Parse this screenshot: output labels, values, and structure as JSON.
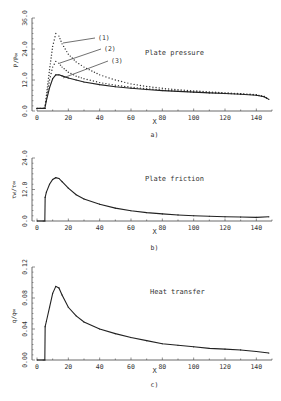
{
  "chart_data": [
    {
      "type": "line",
      "panel_label": "a)",
      "title": "Plate pressure",
      "xlabel": "X",
      "ylabel": "P/P∞",
      "xlim": [
        0,
        150
      ],
      "ylim": [
        0,
        36
      ],
      "xticks": [
        0,
        20,
        40,
        60,
        80,
        100,
        120,
        140
      ],
      "yticks": [
        0.0,
        12.0,
        24.0,
        36.0
      ],
      "ytick_labels": [
        "0.0",
        "12.0",
        "24.0",
        "36.0"
      ],
      "x": [
        0,
        4,
        5,
        6,
        8,
        10,
        12,
        14,
        16,
        20,
        25,
        30,
        40,
        50,
        60,
        70,
        80,
        90,
        100,
        110,
        120,
        130,
        140,
        145,
        148
      ],
      "series": [
        {
          "name": "(1)",
          "style": "dotted",
          "values": [
            1,
            1,
            1,
            6,
            16,
            25,
            30,
            29,
            26,
            22,
            19,
            17,
            14,
            12,
            10.5,
            9.5,
            8.8,
            8.2,
            7.8,
            7.4,
            7.0,
            6.7,
            6.3,
            5.6,
            4.5
          ]
        },
        {
          "name": "(2)",
          "style": "dotted",
          "values": [
            1,
            1,
            1,
            5,
            12,
            17,
            19.2,
            18.5,
            17,
            15,
            13.5,
            12.5,
            11,
            10,
            9.2,
            8.6,
            8.1,
            7.7,
            7.4,
            7.1,
            6.8,
            6.6,
            6.2,
            5.6,
            4.5
          ]
        },
        {
          "name": "(3)",
          "style": "solid",
          "values": [
            1,
            1,
            1,
            4,
            9,
            12.5,
            14,
            14,
            13.6,
            12.8,
            12,
            11.2,
            10.2,
            9.4,
            8.8,
            8.3,
            7.9,
            7.6,
            7.3,
            7.0,
            6.8,
            6.5,
            6.1,
            5.5,
            4.5
          ]
        }
      ],
      "annotations": [
        "(1)",
        "(2)",
        "(3)"
      ]
    },
    {
      "type": "line",
      "panel_label": "b)",
      "title": "Plate friction",
      "xlabel": "X",
      "ylabel": "τw/τ∞",
      "xlim": [
        0,
        150
      ],
      "ylim": [
        0,
        24
      ],
      "xticks": [
        0,
        20,
        40,
        60,
        80,
        100,
        120,
        140
      ],
      "yticks": [
        0.0,
        12.0,
        24.0
      ],
      "ytick_labels": [
        "0.0",
        "12.0",
        "24.0"
      ],
      "x": [
        0,
        4,
        5,
        5.2,
        6,
        8,
        10,
        12,
        14,
        16,
        20,
        25,
        30,
        40,
        50,
        60,
        70,
        80,
        90,
        100,
        110,
        120,
        130,
        140,
        148
      ],
      "series": [
        {
          "name": "friction",
          "style": "solid",
          "values": [
            0,
            0,
            0,
            9,
            11,
            14,
            15.8,
            16.5,
            16.2,
            15,
            12.5,
            10,
            8.4,
            6.4,
            4.9,
            3.9,
            3.2,
            2.7,
            2.3,
            2.0,
            1.8,
            1.6,
            1.5,
            1.4,
            1.6
          ]
        }
      ]
    },
    {
      "type": "line",
      "panel_label": "c)",
      "title": "Heat transfer",
      "xlabel": "X",
      "ylabel": "q/q∞",
      "xlim": [
        0,
        150
      ],
      "ylim": [
        0,
        0.12
      ],
      "xticks": [
        0,
        20,
        40,
        60,
        80,
        100,
        120,
        140
      ],
      "yticks": [
        0.0,
        0.04,
        0.08,
        0.12
      ],
      "ytick_labels": [
        "0.00",
        "0.04",
        "0.08",
        "0.12"
      ],
      "x": [
        0,
        4,
        5,
        5.2,
        6,
        8,
        10,
        12,
        14,
        16,
        20,
        25,
        30,
        40,
        50,
        60,
        70,
        80,
        90,
        100,
        110,
        120,
        130,
        140,
        148
      ],
      "series": [
        {
          "name": "heat",
          "style": "solid",
          "values": [
            0,
            0,
            0,
            0.043,
            0.05,
            0.068,
            0.086,
            0.095,
            0.093,
            0.084,
            0.068,
            0.057,
            0.049,
            0.04,
            0.034,
            0.029,
            0.025,
            0.021,
            0.019,
            0.017,
            0.015,
            0.014,
            0.013,
            0.011,
            0.009
          ]
        }
      ]
    }
  ],
  "panels": {
    "a": {
      "title": "Plate pressure",
      "label": "a)",
      "xlabel": "X",
      "ylabel": "P/P∞"
    },
    "b": {
      "title": "Plate friction",
      "label": "b)",
      "xlabel": "X",
      "ylabel": "τw/τ∞"
    },
    "c": {
      "title": "Heat transfer",
      "label": "c)",
      "xlabel": "X",
      "ylabel": "q/q∞"
    }
  }
}
